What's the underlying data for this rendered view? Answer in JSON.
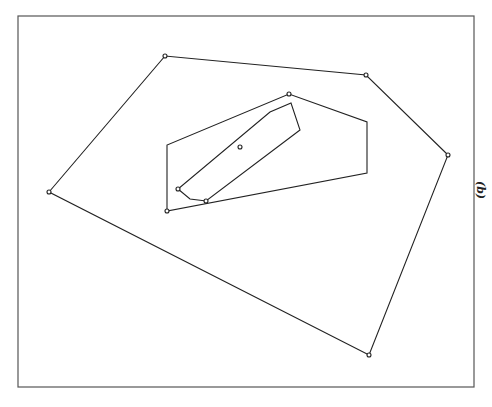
{
  "figure": {
    "label": "(b)",
    "frame": {
      "x": 18,
      "y": 16,
      "width": 456,
      "height": 371
    },
    "stroke_color": "#222222",
    "frame_color": "#555555",
    "outer_hull": [
      [
        49,
        192
      ],
      [
        165,
        56
      ],
      [
        366,
        75
      ],
      [
        448,
        155
      ],
      [
        369,
        355
      ]
    ],
    "middle_hull": [
      [
        167,
        211
      ],
      [
        167,
        145
      ],
      [
        289,
        94
      ],
      [
        367,
        122
      ],
      [
        367,
        173
      ]
    ],
    "inner_hull": [
      [
        178,
        189
      ],
      [
        190,
        199
      ],
      [
        206,
        201
      ],
      [
        300,
        130
      ],
      [
        291,
        103
      ],
      [
        270,
        112
      ]
    ],
    "points": [
      [
        49,
        192
      ],
      [
        165,
        56
      ],
      [
        366,
        75
      ],
      [
        448,
        155
      ],
      [
        369,
        355
      ],
      [
        167,
        211
      ],
      [
        289,
        94
      ],
      [
        178,
        189
      ],
      [
        206,
        201
      ],
      [
        240,
        147
      ]
    ]
  }
}
